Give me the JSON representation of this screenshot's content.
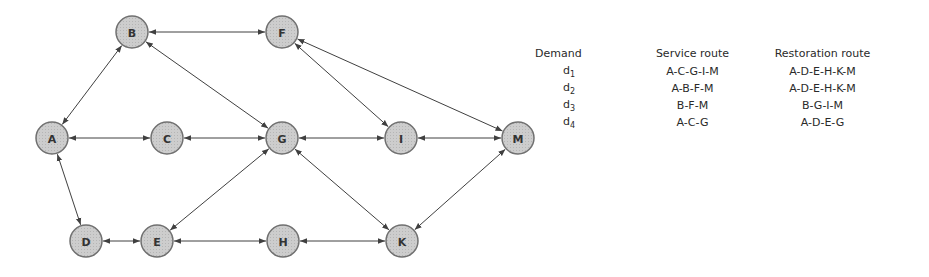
{
  "graph": {
    "nodes": [
      {
        "id": "A",
        "x": 52,
        "y": 138
      },
      {
        "id": "B",
        "x": 132,
        "y": 32
      },
      {
        "id": "C",
        "x": 167,
        "y": 138
      },
      {
        "id": "D",
        "x": 86,
        "y": 241
      },
      {
        "id": "E",
        "x": 157,
        "y": 241
      },
      {
        "id": "F",
        "x": 282,
        "y": 32
      },
      {
        "id": "G",
        "x": 282,
        "y": 138
      },
      {
        "id": "H",
        "x": 283,
        "y": 241
      },
      {
        "id": "I",
        "x": 401,
        "y": 138
      },
      {
        "id": "K",
        "x": 402,
        "y": 241
      },
      {
        "id": "M",
        "x": 518,
        "y": 138
      }
    ],
    "edges": [
      [
        "A",
        "B"
      ],
      [
        "B",
        "F"
      ],
      [
        "B",
        "G"
      ],
      [
        "F",
        "I"
      ],
      [
        "F",
        "M"
      ],
      [
        "A",
        "C"
      ],
      [
        "C",
        "G"
      ],
      [
        "G",
        "I"
      ],
      [
        "I",
        "M"
      ],
      [
        "A",
        "D"
      ],
      [
        "D",
        "E"
      ],
      [
        "E",
        "G"
      ],
      [
        "E",
        "H"
      ],
      [
        "G",
        "K"
      ],
      [
        "H",
        "K"
      ],
      [
        "K",
        "M"
      ]
    ],
    "node_radius": 16,
    "node_fill": "#c8c8c8",
    "node_stroke": "#707070",
    "edge_color": "#404040"
  },
  "table": {
    "headers": {
      "demand": "Demand",
      "service": "Service route",
      "restoration": "Restoration route"
    },
    "rows": [
      {
        "demand": "d",
        "sub": "1",
        "service": "A-C-G-I-M",
        "restoration": "A-D-E-H-K-M"
      },
      {
        "demand": "d",
        "sub": "2",
        "service": "A-B-F-M",
        "restoration": "A-D-E-H-K-M"
      },
      {
        "demand": "d",
        "sub": "3",
        "service": "B-F-M",
        "restoration": "B-G-I-M"
      },
      {
        "demand": "d",
        "sub": "4",
        "service": "A-C-G",
        "restoration": "A-D-E-G"
      }
    ]
  }
}
